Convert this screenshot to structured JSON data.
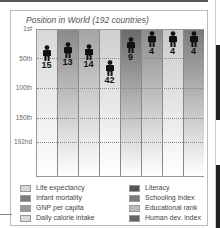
{
  "chart_data": {
    "type": "bar",
    "title": "Position in World (192 countries)",
    "ylabel": "Position in World",
    "y_ticks": [
      "1st",
      "50th",
      "100th",
      "150th",
      "192nd"
    ],
    "y_inverted": true,
    "ylim": [
      1,
      192
    ],
    "categories": [
      "Life expectancy",
      "Infant mortality",
      "GNP per capita",
      "Daily calorie intake",
      "Literacy",
      "Schooling index",
      "Educational rank",
      "Human dev. index"
    ],
    "values": [
      15,
      13,
      14,
      42,
      9,
      4,
      4,
      4
    ],
    "colors": [
      "#d6d6d6",
      "#8a8a8a",
      "#a6a6a6",
      "#d0d0d0",
      "#6c6c6c",
      "#8d8d8d",
      "#cbcbcb",
      "#7c7c7c"
    ],
    "legend_position": "bottom",
    "grid": true
  },
  "title": "Position in World (192 countries)",
  "yaxis": {
    "t1": "1st",
    "t50": "50th",
    "t100": "100th",
    "t150": "150th",
    "t192": "192nd"
  },
  "bars": [
    {
      "label": "15"
    },
    {
      "label": "13"
    },
    {
      "label": "14"
    },
    {
      "label": "42"
    },
    {
      "label": "9"
    },
    {
      "label": "4"
    },
    {
      "label": "4"
    },
    {
      "label": "4"
    }
  ],
  "legend": [
    "Life expectancy",
    "Infant mortality",
    "GNP per capita",
    "Daily calorie intake",
    "Literacy",
    "Schooling index",
    "Educational rank",
    "Human dev. index"
  ]
}
